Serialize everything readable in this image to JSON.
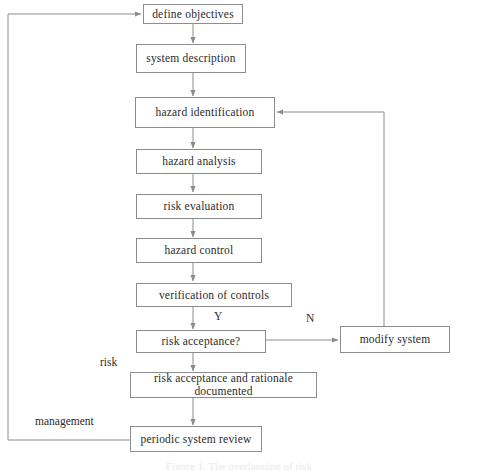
{
  "diagram": {
    "line_color": "#8c8c8c",
    "text_color": "#2b2b2b",
    "background": "#ffffff",
    "nodes": [
      {
        "id": "define_objectives",
        "label": "define objectives"
      },
      {
        "id": "system_description",
        "label": "system description"
      },
      {
        "id": "hazard_identification",
        "label": "hazard identification"
      },
      {
        "id": "hazard_analysis",
        "label": "hazard analysis"
      },
      {
        "id": "risk_evaluation",
        "label": "risk evaluation"
      },
      {
        "id": "hazard_control",
        "label": "hazard control"
      },
      {
        "id": "verification_of_controls",
        "label": "verification of controls"
      },
      {
        "id": "risk_acceptance",
        "label": "risk acceptance?"
      },
      {
        "id": "modify_system",
        "label": "modify system"
      },
      {
        "id": "risk_acceptance_documented",
        "label": "risk acceptance and rationale documented"
      },
      {
        "id": "periodic_system_review",
        "label": "periodic system review"
      }
    ],
    "edge_labels": [
      {
        "id": "yes_branch",
        "label": "Y"
      },
      {
        "id": "no_branch",
        "label": "N"
      },
      {
        "id": "risk_loop",
        "label": "risk"
      },
      {
        "id": "management_loop",
        "label": "management"
      }
    ],
    "caption": "Figure 1.  The overlapping of risk"
  }
}
